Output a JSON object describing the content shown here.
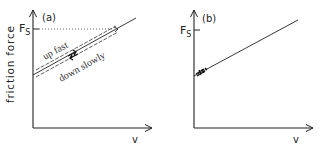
{
  "figure": {
    "ink_color": "#222222",
    "panels": [
      {
        "id": "a",
        "label": "(a)",
        "y_label": "friction force",
        "x_label": "v",
        "level_label": "F",
        "level_subscript": "S",
        "annotation_upper": "up fast",
        "annotation_lower": "down slowly"
      },
      {
        "id": "b",
        "label": "(b)",
        "x_label": "v",
        "level_label": "F",
        "level_subscript": "S"
      }
    ]
  }
}
